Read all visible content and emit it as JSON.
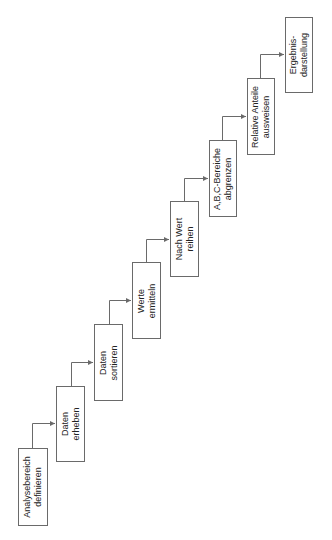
{
  "diagram": {
    "type": "process-staircase",
    "orientation": "rotated-90-ccw",
    "line_color": "#6a6a6a",
    "text_color": "#222222",
    "steps": [
      {
        "id": 1,
        "label": "Analysebereich\ndefinieren",
        "x": 18,
        "y": 448,
        "w": 30,
        "h": 78
      },
      {
        "id": 2,
        "label": "Daten\nerheben",
        "x": 56,
        "y": 386,
        "w": 29,
        "h": 76
      },
      {
        "id": 3,
        "label": "Daten\nsortieren",
        "x": 94,
        "y": 324,
        "w": 29,
        "h": 77
      },
      {
        "id": 4,
        "label": "Werte\nermitteln",
        "x": 132,
        "y": 262,
        "w": 29,
        "h": 77
      },
      {
        "id": 5,
        "label": "Nach Wert\nreihen",
        "x": 170,
        "y": 201,
        "w": 29,
        "h": 76
      },
      {
        "id": 6,
        "label": "A,B,C-Bereiche\nabgrenzen",
        "x": 209,
        "y": 140,
        "w": 28,
        "h": 77
      },
      {
        "id": 7,
        "label": "Relative Anteile\nausweisen",
        "x": 247,
        "y": 78,
        "w": 28,
        "h": 77
      },
      {
        "id": 8,
        "label": "Ergebnis-\ndarstellung",
        "x": 285,
        "y": 17,
        "w": 28,
        "h": 76
      }
    ],
    "connectors": [
      {
        "from": 1,
        "to": 2,
        "vx": 32,
        "y_start": 448,
        "y_turn": 423,
        "x_end": 56
      },
      {
        "from": 2,
        "to": 3,
        "vx": 71,
        "y_start": 386,
        "y_turn": 362,
        "x_end": 94
      },
      {
        "from": 3,
        "to": 4,
        "vx": 109,
        "y_start": 324,
        "y_turn": 300,
        "x_end": 132
      },
      {
        "from": 4,
        "to": 5,
        "vx": 146,
        "y_start": 262,
        "y_turn": 239,
        "x_end": 170
      },
      {
        "from": 5,
        "to": 6,
        "vx": 184,
        "y_start": 201,
        "y_turn": 178,
        "x_end": 209
      },
      {
        "from": 6,
        "to": 7,
        "vx": 222,
        "y_start": 140,
        "y_turn": 116,
        "x_end": 247
      },
      {
        "from": 7,
        "to": 8,
        "vx": 260,
        "y_start": 78,
        "y_turn": 54,
        "x_end": 285
      }
    ]
  }
}
